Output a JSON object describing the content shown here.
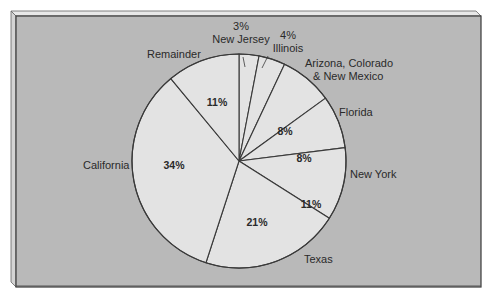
{
  "chart_data": {
    "type": "pie",
    "title": "",
    "start_angle_deg": 0,
    "direction": "clockwise",
    "categories": [
      "New Jersey",
      "Illinois",
      "Arizona, Colorado & New Mexico",
      "Florida",
      "New York",
      "Texas",
      "California",
      "Remainder"
    ],
    "values": [
      3,
      4,
      8,
      8,
      11,
      21,
      34,
      11
    ],
    "value_labels": [
      "3%",
      "4%",
      "8%",
      "8%",
      "11%",
      "21%",
      "34%",
      "11%"
    ],
    "labels_inside": [
      false,
      false,
      true,
      true,
      true,
      true,
      true,
      true
    ],
    "colors": {
      "panel_background": "#b9b9b9",
      "slice_fill": "#e3e3e3",
      "line": "#3a3a3a",
      "text": "#2a2a2a"
    }
  },
  "slices": [
    {
      "name": "New Jersey",
      "pct_label": "3%",
      "label_lines": [
        "New Jersey"
      ]
    },
    {
      "name": "Illinois",
      "pct_label": "4%",
      "label_lines": [
        "Illinois"
      ]
    },
    {
      "name": "Arizona, Colorado & New Mexico",
      "pct_label": "8%",
      "label_lines": [
        "Arizona, Colorado",
        "& New Mexico"
      ]
    },
    {
      "name": "Florida",
      "pct_label": "8%",
      "label_lines": [
        "Florida"
      ]
    },
    {
      "name": "New York",
      "pct_label": "11%",
      "label_lines": [
        "New York"
      ]
    },
    {
      "name": "Texas",
      "pct_label": "21%",
      "label_lines": [
        "Texas"
      ]
    },
    {
      "name": "California",
      "pct_label": "34%",
      "label_lines": [
        "California"
      ]
    },
    {
      "name": "Remainder",
      "pct_label": "11%",
      "label_lines": [
        "Remainder"
      ]
    }
  ]
}
